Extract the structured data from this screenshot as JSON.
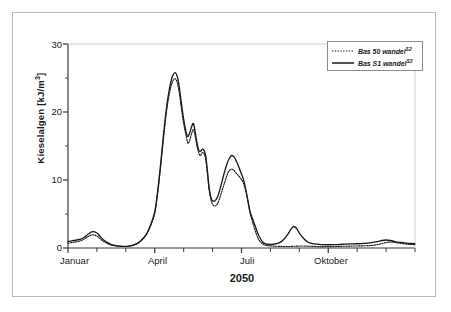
{
  "figure": {
    "x_axis_title": "2050",
    "y_axis_title_main": "Kieselalgen [kJ/m",
    "y_axis_title_sup": "3",
    "y_axis_title_close": "]"
  },
  "legend": {
    "position": "top-right",
    "entries": [
      {
        "label": "Bas 50 wandel",
        "sup": "S2",
        "style": "dotted",
        "color": "#1a1a1a"
      },
      {
        "label": "Bas S1 wandel",
        "sup": "S3",
        "style": "solid",
        "color": "#1a1a1a"
      }
    ]
  },
  "axes": {
    "y_ticks": [
      "0",
      "10",
      "20",
      "30"
    ],
    "x_ticks": [
      "Januar",
      "April",
      "Juli",
      "Oktober"
    ]
  },
  "chart_data": {
    "type": "line",
    "title": "",
    "subtitle": "",
    "xlabel": "2050",
    "ylabel": "Kieselalgen [kJ/m³]",
    "ylim": [
      0,
      30
    ],
    "xlim": [
      0,
      12
    ],
    "grid": false,
    "legend_position": "top-right",
    "x_tick_labels": [
      "Januar",
      "April",
      "Juli",
      "Oktober"
    ],
    "x_tick_positions": [
      0,
      3,
      6,
      9
    ],
    "x_minor_tick_positions": [
      0,
      1,
      2,
      3,
      4,
      5,
      6,
      7,
      8,
      9,
      10,
      11,
      12
    ],
    "y_tick_values": [
      0,
      10,
      20,
      30
    ],
    "y_minor_tick_values": [
      5,
      15,
      25
    ],
    "x_units": "months of year 2050",
    "series": [
      {
        "name": "Bas 50 wandel",
        "sup": "S2",
        "style": "dotted",
        "color": "#1a1a1a",
        "x": [
          0.0,
          0.2,
          0.4,
          0.55,
          0.7,
          0.85,
          1.0,
          1.1,
          1.2,
          1.35,
          1.5,
          1.7,
          1.9,
          2.1,
          2.3,
          2.5,
          2.7,
          2.85,
          3.0,
          3.1,
          3.2,
          3.3,
          3.4,
          3.5,
          3.6,
          3.7,
          3.78,
          3.85,
          3.92,
          4.0,
          4.08,
          4.15,
          4.22,
          4.28,
          4.34,
          4.4,
          4.46,
          4.52,
          4.58,
          4.64,
          4.7,
          4.76,
          4.82,
          4.88,
          4.95,
          5.02,
          5.1,
          5.18,
          5.26,
          5.34,
          5.42,
          5.5,
          5.58,
          5.66,
          5.74,
          5.82,
          5.9,
          5.98,
          6.06,
          6.14,
          6.22,
          6.3,
          6.4,
          6.5,
          6.6,
          6.75,
          6.9,
          7.1,
          7.3,
          7.5,
          7.65,
          7.8,
          7.95,
          8.1,
          8.25,
          8.4,
          8.6,
          8.8,
          9.0,
          9.25,
          9.5,
          9.75,
          10.0,
          10.25,
          10.5,
          10.7,
          10.85,
          11.0,
          11.15,
          11.3,
          11.5,
          11.7,
          11.85,
          12.0
        ],
        "y": [
          0.7,
          0.85,
          1.0,
          1.3,
          1.7,
          1.95,
          1.75,
          1.4,
          1.05,
          0.7,
          0.42,
          0.28,
          0.22,
          0.25,
          0.45,
          0.95,
          1.9,
          3.2,
          5.1,
          8.0,
          11.8,
          16.0,
          19.8,
          22.6,
          24.3,
          24.9,
          24.3,
          22.8,
          20.6,
          18.3,
          16.6,
          15.4,
          16.0,
          16.9,
          17.4,
          16.4,
          15.0,
          14.0,
          13.6,
          14.0,
          13.9,
          13.1,
          11.0,
          8.6,
          7.0,
          6.3,
          6.2,
          6.6,
          7.5,
          8.6,
          9.7,
          10.7,
          11.4,
          11.6,
          11.4,
          11.0,
          10.6,
          10.2,
          9.6,
          8.5,
          6.9,
          5.1,
          3.6,
          2.2,
          1.2,
          0.55,
          0.35,
          0.28,
          0.24,
          0.22,
          0.22,
          0.25,
          0.28,
          0.3,
          0.28,
          0.25,
          0.22,
          0.2,
          0.2,
          0.22,
          0.25,
          0.28,
          0.3,
          0.32,
          0.38,
          0.5,
          0.65,
          0.8,
          0.88,
          0.82,
          0.68,
          0.58,
          0.52,
          0.48
        ]
      },
      {
        "name": "Bas S1 wandel",
        "sup": "S3",
        "style": "solid",
        "color": "#1a1a1a",
        "x": [
          0.0,
          0.2,
          0.4,
          0.55,
          0.7,
          0.85,
          1.0,
          1.1,
          1.2,
          1.35,
          1.5,
          1.7,
          1.9,
          2.1,
          2.3,
          2.5,
          2.7,
          2.85,
          3.0,
          3.1,
          3.2,
          3.3,
          3.4,
          3.5,
          3.6,
          3.7,
          3.78,
          3.85,
          3.92,
          4.0,
          4.08,
          4.15,
          4.22,
          4.28,
          4.34,
          4.4,
          4.46,
          4.52,
          4.58,
          4.64,
          4.7,
          4.76,
          4.82,
          4.88,
          4.95,
          5.02,
          5.1,
          5.18,
          5.26,
          5.34,
          5.42,
          5.5,
          5.58,
          5.66,
          5.74,
          5.82,
          5.9,
          5.98,
          6.06,
          6.14,
          6.22,
          6.3,
          6.4,
          6.5,
          6.6,
          6.75,
          6.9,
          7.1,
          7.3,
          7.45,
          7.6,
          7.7,
          7.8,
          7.9,
          8.0,
          8.15,
          8.3,
          8.5,
          8.75,
          9.0,
          9.25,
          9.5,
          9.75,
          10.0,
          10.25,
          10.5,
          10.7,
          10.85,
          11.0,
          11.15,
          11.3,
          11.5,
          11.7,
          11.85,
          12.0
        ],
        "y": [
          0.95,
          1.1,
          1.25,
          1.55,
          2.05,
          2.4,
          2.2,
          1.75,
          1.3,
          0.85,
          0.5,
          0.32,
          0.24,
          0.27,
          0.48,
          1.0,
          1.95,
          3.3,
          5.3,
          8.3,
          12.2,
          16.5,
          20.4,
          23.2,
          25.1,
          25.8,
          25.2,
          23.6,
          21.3,
          18.9,
          17.1,
          16.4,
          17.1,
          17.9,
          18.3,
          17.0,
          15.5,
          14.4,
          14.2,
          14.5,
          14.4,
          13.6,
          11.4,
          8.9,
          7.3,
          6.9,
          7.0,
          7.6,
          8.7,
          10.0,
          11.3,
          12.4,
          13.2,
          13.6,
          13.4,
          12.8,
          12.0,
          11.1,
          10.2,
          8.8,
          7.0,
          5.3,
          4.1,
          2.9,
          1.8,
          0.8,
          0.55,
          0.55,
          0.75,
          1.2,
          2.0,
          2.7,
          3.15,
          2.9,
          2.2,
          1.4,
          0.85,
          0.6,
          0.5,
          0.48,
          0.5,
          0.55,
          0.6,
          0.62,
          0.68,
          0.8,
          0.95,
          1.1,
          1.18,
          1.1,
          0.95,
          0.82,
          0.72,
          0.66,
          0.62
        ]
      }
    ]
  }
}
